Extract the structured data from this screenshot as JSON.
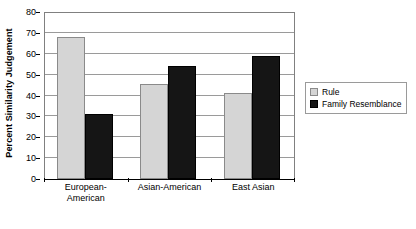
{
  "chart_data": {
    "type": "bar",
    "title": "",
    "xlabel": "",
    "ylabel": "Percent Similarity Judgement",
    "ylim": [
      0,
      80
    ],
    "ytick_step": 10,
    "yticks": [
      80,
      70,
      60,
      50,
      40,
      30,
      20,
      10,
      0
    ],
    "grid": true,
    "legend_position": "right",
    "categories": [
      "European-American",
      "Asian-American",
      "East Asian"
    ],
    "category_lines": [
      [
        "European-",
        "American"
      ],
      [
        "Asian-American"
      ],
      [
        "East Asian"
      ]
    ],
    "series": [
      {
        "name": "Rule",
        "color": "#d5d5d5",
        "values": [
          68,
          45.5,
          41
        ]
      },
      {
        "name": "Family Resemblance",
        "color": "#151515",
        "values": [
          31,
          54,
          59
        ]
      }
    ]
  },
  "legend": {
    "items": [
      {
        "label": "Rule"
      },
      {
        "label": "Family Resemblance"
      }
    ]
  },
  "colors": {
    "rule": "#d5d5d5",
    "family_resemblance": "#151515",
    "gridline": "#9a9a9a",
    "axis": "#000000",
    "background": "#ffffff"
  }
}
